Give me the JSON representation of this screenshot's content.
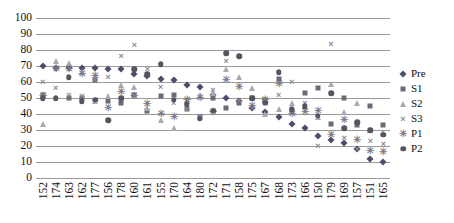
{
  "chart_data": {
    "type": "scatter",
    "title": "",
    "xlabel": "",
    "ylabel": "",
    "ylim": [
      0,
      100
    ],
    "ytick_step": 10,
    "grid": true,
    "legend_position": "right",
    "yticks": [
      "100",
      "90",
      "80",
      "70",
      "60",
      "50",
      "40",
      "30",
      "20",
      "10",
      "0"
    ],
    "categories": [
      "152",
      "174",
      "163",
      "162",
      "177",
      "156",
      "178",
      "160",
      "161",
      "155",
      "170",
      "164",
      "180",
      "172",
      "171",
      "158",
      "175",
      "167",
      "168",
      "173",
      "166",
      "150",
      "179",
      "169",
      "157",
      "151",
      "165"
    ],
    "series": [
      {
        "name": "Pre",
        "marker": "diamond",
        "color": "#4d4d6b",
        "values": [
          70,
          69,
          69,
          69,
          69,
          68,
          68,
          65,
          64,
          62,
          61,
          58,
          57,
          52,
          50,
          48,
          44,
          41,
          38,
          34,
          31,
          26,
          24,
          22,
          18,
          12,
          10
        ]
      },
      {
        "name": "S1",
        "marker": "square",
        "color": "#6b6b78",
        "values": [
          52,
          null,
          50,
          50,
          61,
          48,
          47,
          52,
          42,
          51,
          52,
          43,
          38,
          50,
          44,
          47,
          50,
          49,
          62,
          42,
          53,
          56,
          34,
          50,
          33,
          45,
          33
        ]
      },
      {
        "name": "S2",
        "marker": "triangle",
        "color": "#a9a9b4",
        "values": [
          34,
          73,
          72,
          66,
          48,
          51,
          58,
          57,
          44,
          36,
          31,
          48,
          52,
          53,
          68,
          63,
          56,
          40,
          43,
          47,
          45,
          38,
          59,
          41,
          47,
          30,
          29
        ]
      },
      {
        "name": "S3",
        "marker": "x",
        "color": "#8a8a95",
        "values": [
          60,
          56,
          52,
          51,
          61,
          63,
          76,
          83,
          68,
          57,
          47,
          43,
          39,
          55,
          73,
          49,
          44,
          46,
          52,
          60,
          47,
          20,
          84,
          25,
          18,
          23,
          21
        ]
      },
      {
        "name": "P1",
        "marker": "asterisk",
        "color": "#7a7a86",
        "values": [
          51,
          68,
          68,
          65,
          64,
          44,
          54,
          51,
          46,
          40,
          38,
          49,
          50,
          41,
          61,
          57,
          45,
          49,
          59,
          40,
          41,
          42,
          27,
          36,
          24,
          17,
          16
        ]
      },
      {
        "name": "P2",
        "marker": "circle",
        "color": "#55555f",
        "values": [
          50,
          50,
          63,
          48,
          49,
          36,
          50,
          68,
          65,
          71,
          49,
          46,
          37,
          42,
          78,
          76,
          50,
          47,
          66,
          43,
          45,
          39,
          53,
          31,
          35,
          30,
          27
        ]
      }
    ],
    "legend": [
      {
        "label": "Pre",
        "marker": "diamond"
      },
      {
        "label": "S1",
        "marker": "square"
      },
      {
        "label": "S2",
        "marker": "triangle"
      },
      {
        "label": "S3",
        "marker": "x"
      },
      {
        "label": "P1",
        "marker": "asterisk"
      },
      {
        "label": "P2",
        "marker": "circle"
      }
    ]
  }
}
